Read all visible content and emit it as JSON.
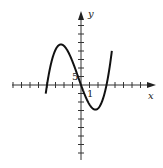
{
  "chart_data": {
    "type": "line",
    "title": "",
    "xlabel": "x",
    "ylabel": "y",
    "x_tick_label": "1",
    "y_tick_label": "5",
    "x_tick_unit": 1,
    "y_tick_unit": 5,
    "xlim": [
      -8,
      8
    ],
    "ylim": [
      -45,
      45
    ],
    "grid": false,
    "legend": null,
    "series": [
      {
        "name": "cubic",
        "description": "Cubic polynomial with roots near x=-4, 0, 3; local max near x=-2.2, local min near x=1.6",
        "x": [
          -4.1,
          -4,
          -3,
          -2.2,
          -1,
          0,
          1,
          1.6,
          2.5,
          3,
          3.6
        ],
        "y": [
          -42,
          0,
          24,
          29,
          16,
          0,
          -20,
          -24,
          -12,
          0,
          42
        ]
      }
    ]
  },
  "labels": {
    "x_axis": "x",
    "y_axis": "y",
    "x_tick": "1",
    "y_tick": "5"
  },
  "colors": {
    "curve": "#111111",
    "axes": "#333333"
  }
}
